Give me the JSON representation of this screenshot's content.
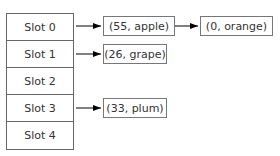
{
  "diagram": {
    "type": "hash-table-chaining",
    "slots": [
      {
        "label": "Slot 0",
        "chain": [
          "(55, apple)",
          "(0, orange)"
        ]
      },
      {
        "label": "Slot 1",
        "chain": [
          "(26, grape)"
        ]
      },
      {
        "label": "Slot 2",
        "chain": []
      },
      {
        "label": "Slot 3",
        "chain": [
          "(33, plum)"
        ]
      },
      {
        "label": "Slot 4",
        "chain": []
      }
    ]
  },
  "colors": {
    "border": "#666666",
    "text": "#333333",
    "arrow": "#000000"
  }
}
